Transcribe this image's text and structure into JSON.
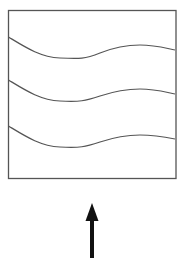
{
  "diagram": {
    "box": {
      "x": 8.5,
      "y": 10.5,
      "width": 167.5,
      "height": 168,
      "stroke": "#555555"
    },
    "waves": [
      {
        "name": "wave-1",
        "path": "M8.5,37 C25,47 40,57 60,58 C80,59 85,59 100,53 C115,47 125,45 140,45 C155,45 165,48 175,50"
      },
      {
        "name": "wave-2",
        "path": "M8.5,80 C25,90 40,100 60,101 C80,102 85,101 100,96 C115,91 125,89 140,89 C155,89 165,92 175,94"
      },
      {
        "name": "wave-3",
        "path": "M8.5,126 C25,136 40,146 60,147 C80,148 85,147 100,142 C115,137 125,135 140,135 C155,135 165,137 175,139"
      }
    ],
    "wave_color": "#555555",
    "arrow": {
      "direction": "up",
      "x": 92,
      "tip_y": 203,
      "head_base_y": 221,
      "tail_y": 258,
      "color": "#111111"
    }
  }
}
